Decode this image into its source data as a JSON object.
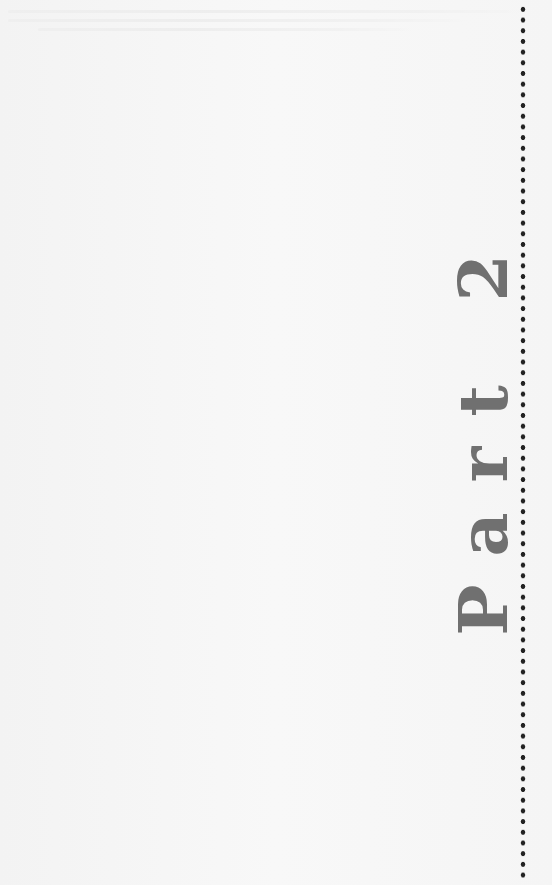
{
  "page": {
    "type": "part-divider",
    "background_color": "#f6f6f6"
  },
  "title": {
    "text": "Part 2",
    "orientation": "vertical-bottom-to-top",
    "color": "#707070"
  },
  "decoration": {
    "rule_style": "dotted-vertical",
    "dot_color": "#222222"
  }
}
